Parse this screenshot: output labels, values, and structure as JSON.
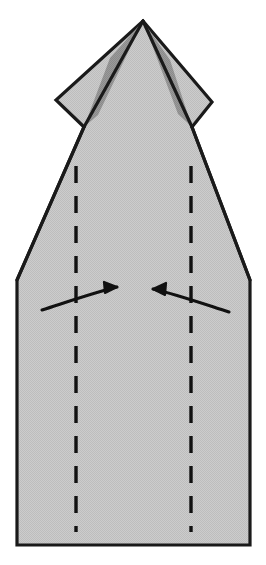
{
  "figure": {
    "description": "Flat paper model shown from the front: a pointed top flap with two side wings above a tall pentagonal body. Two vertical dashed valley-fold lines run down the body and two curved arrows point inward toward the centre, indicating that both side panels fold in.",
    "step_label": "",
    "caption": ""
  },
  "canvas": {
    "width": 266,
    "height": 565,
    "background": "#ffffff"
  },
  "colors": {
    "paper_fill": "#c9c9c9",
    "paper_shadow_fill": "#8f8f8f",
    "outline": "#1a1a1a",
    "crease_line": "#111111",
    "arrow": "#111111",
    "background": "#ffffff"
  },
  "shapes": {
    "body": {
      "name": "paper-body",
      "points": "143,21 212,102 192,127 250,280 250,545 17,545 17,280 84,127 56,100"
    },
    "left_wing": {
      "name": "left-wing-flap",
      "points": "143,21 84,127 56,100"
    },
    "right_wing": {
      "name": "right-wing-flap",
      "points": "143,21 212,102 192,127"
    },
    "left_shadow": {
      "name": "left-shadow-sliver",
      "points": "143,21 98,115 84,127 110,58"
    },
    "right_shadow": {
      "name": "right-shadow-sliver",
      "points": "143,21 178,114 192,127 170,60"
    },
    "center_left_edge": {
      "name": "center-left-edge",
      "path": "M143,21 L84,127"
    },
    "center_right_edge": {
      "name": "center-right-edge",
      "path": "M143,21 L192,127"
    },
    "body_left_edge": {
      "name": "body-left-taper-edge",
      "path": "M84,127 L17,280"
    },
    "body_right_edge": {
      "name": "body-right-taper-edge",
      "path": "M192,127 L250,280"
    }
  },
  "creases": {
    "left_fold_line": {
      "name": "left-valley-fold-line",
      "x": 76,
      "y_start": 166,
      "y_end": 532,
      "style": "dashed"
    },
    "right_fold_line": {
      "name": "right-valley-fold-line",
      "x": 191,
      "y_start": 166,
      "y_end": 532,
      "style": "dashed"
    },
    "dash_pattern": "17 13",
    "stroke_width": 3.4
  },
  "arrows": [
    {
      "name": "left-fold-arrow",
      "direction": "right",
      "label": "fold left panel in",
      "path": "M42,310 C70,301 96,292 117,287",
      "head": "117,287 104,282 105,293"
    },
    {
      "name": "right-fold-arrow",
      "direction": "left",
      "label": "fold right panel in",
      "path": "M229,312 C201,303 175,294 153,289",
      "head": "153,289 166,283 165,295"
    }
  ]
}
